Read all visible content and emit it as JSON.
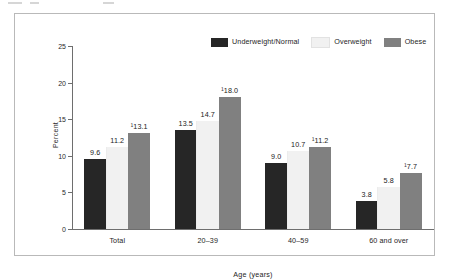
{
  "chart_data": {
    "type": "bar",
    "title": "",
    "xlabel": "Age (years)",
    "ylabel": "Percent",
    "ylim": [
      0,
      25
    ],
    "yticks": [
      0,
      5,
      10,
      15,
      20,
      25
    ],
    "ytick_labels": [
      "0",
      "5",
      "10",
      "15",
      "20",
      "25"
    ],
    "grid": false,
    "legend_position": "top-right",
    "categories": [
      "Total",
      "20–39",
      "40–59",
      "60 and over"
    ],
    "series": [
      {
        "name": "Underweight/Normal",
        "color": "#262626",
        "values": [
          9.6,
          13.5,
          9.0,
          3.8
        ],
        "labels": [
          "9.6",
          "13.5",
          "9.0",
          "3.8"
        ]
      },
      {
        "name": "Overweight",
        "color": "#f1f1f1",
        "values": [
          11.2,
          14.7,
          10.7,
          5.8
        ],
        "labels": [
          "11.2",
          "14.7",
          "10.7",
          "5.8"
        ]
      },
      {
        "name": "Obese",
        "color": "#808080",
        "values": [
          13.1,
          18.0,
          11.2,
          7.7
        ],
        "labels": [
          "¹13.1",
          "¹18.0",
          "¹11.2",
          "¹7.7"
        ]
      }
    ]
  },
  "legend": {
    "items": [
      {
        "label": "Underweight/Normal",
        "color": "#262626"
      },
      {
        "label": "Overweight",
        "color": "#f1f1f1"
      },
      {
        "label": "Obese",
        "color": "#808080"
      }
    ]
  },
  "axes": {
    "y_title": "Percent",
    "x_title": "Age (years)",
    "y_tick_labels": [
      "25",
      "20",
      "15",
      "10",
      "5",
      "0"
    ],
    "x_tick_labels": [
      "Total",
      "20–39",
      "40–59",
      "60 and over"
    ]
  },
  "colors": {
    "frame_border": "#b9b9b9",
    "axis_line": "#6e6e6e",
    "text": "#1e1e1e",
    "background": "#ffffff"
  }
}
